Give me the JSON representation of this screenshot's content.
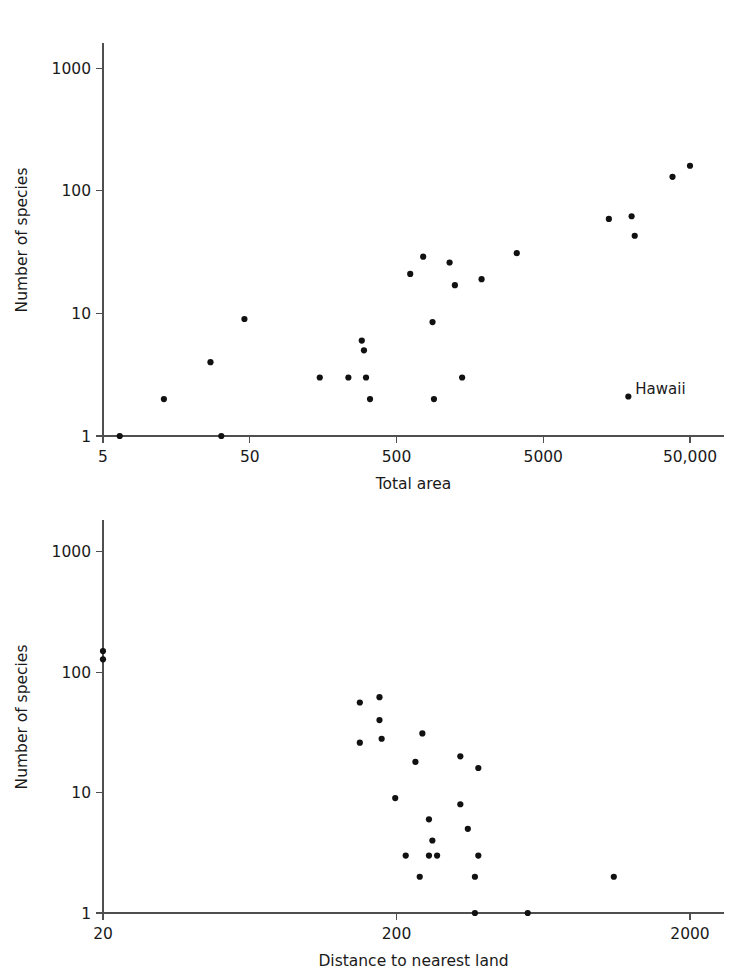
{
  "chart_data": [
    {
      "id": "species-vs-area",
      "type": "scatter",
      "title": "",
      "xlabel": "Total area",
      "ylabel": "Number of species",
      "xscale": "log",
      "yscale": "log",
      "xlim": [
        5,
        70000
      ],
      "ylim": [
        1,
        2000
      ],
      "xticks": [
        5,
        50,
        500,
        5000,
        50000
      ],
      "xticklabels": [
        "5",
        "50",
        "500",
        "5000",
        "50,000"
      ],
      "yticks": [
        1,
        10,
        100,
        1000
      ],
      "yticklabels": [
        "1",
        "10",
        "100",
        "1000"
      ],
      "grid": false,
      "legend": false,
      "points": [
        {
          "x": 6.5,
          "y": 1
        },
        {
          "x": 13,
          "y": 2
        },
        {
          "x": 32,
          "y": 1
        },
        {
          "x": 27,
          "y": 4
        },
        {
          "x": 46,
          "y": 9
        },
        {
          "x": 150,
          "y": 3
        },
        {
          "x": 235,
          "y": 3
        },
        {
          "x": 290,
          "y": 6
        },
        {
          "x": 300,
          "y": 5
        },
        {
          "x": 310,
          "y": 3
        },
        {
          "x": 330,
          "y": 2
        },
        {
          "x": 620,
          "y": 21
        },
        {
          "x": 760,
          "y": 29
        },
        {
          "x": 880,
          "y": 8.5
        },
        {
          "x": 900,
          "y": 2
        },
        {
          "x": 1150,
          "y": 26
        },
        {
          "x": 1250,
          "y": 17
        },
        {
          "x": 1400,
          "y": 3
        },
        {
          "x": 1900,
          "y": 19
        },
        {
          "x": 3300,
          "y": 31
        },
        {
          "x": 14000,
          "y": 59
        },
        {
          "x": 20000,
          "y": 62
        },
        {
          "x": 21000,
          "y": 43
        },
        {
          "x": 38000,
          "y": 130
        },
        {
          "x": 50000,
          "y": 160
        },
        {
          "x": 19000,
          "y": 2.1,
          "label": "Hawaii"
        }
      ],
      "annotations": [
        {
          "text": "Hawaii",
          "x": 19000,
          "y": 2.1
        }
      ]
    },
    {
      "id": "species-vs-distance",
      "type": "scatter",
      "title": "",
      "xlabel": "Distance to nearest land",
      "ylabel": "Number of species",
      "xscale": "log",
      "yscale": "log",
      "xlim": [
        20,
        3000
      ],
      "ylim": [
        1,
        2000
      ],
      "xticks": [
        20,
        200,
        2000
      ],
      "xticklabels": [
        "20",
        "200",
        "2000"
      ],
      "yticks": [
        1,
        10,
        100,
        1000
      ],
      "yticklabels": [
        "1",
        "10",
        "100",
        "1000"
      ],
      "grid": false,
      "legend": false,
      "points": [
        {
          "x": 20,
          "y": 150
        },
        {
          "x": 20,
          "y": 128
        },
        {
          "x": 150,
          "y": 56
        },
        {
          "x": 175,
          "y": 62
        },
        {
          "x": 175,
          "y": 40
        },
        {
          "x": 150,
          "y": 26
        },
        {
          "x": 178,
          "y": 28
        },
        {
          "x": 245,
          "y": 31
        },
        {
          "x": 232,
          "y": 18
        },
        {
          "x": 330,
          "y": 20
        },
        {
          "x": 380,
          "y": 16
        },
        {
          "x": 198,
          "y": 9
        },
        {
          "x": 330,
          "y": 8
        },
        {
          "x": 258,
          "y": 6
        },
        {
          "x": 350,
          "y": 5
        },
        {
          "x": 265,
          "y": 4
        },
        {
          "x": 215,
          "y": 3
        },
        {
          "x": 258,
          "y": 3
        },
        {
          "x": 275,
          "y": 3
        },
        {
          "x": 380,
          "y": 3
        },
        {
          "x": 240,
          "y": 2
        },
        {
          "x": 370,
          "y": 2
        },
        {
          "x": 1100,
          "y": 2
        },
        {
          "x": 370,
          "y": 1
        },
        {
          "x": 560,
          "y": 1
        }
      ],
      "annotations": []
    }
  ],
  "panels": {
    "top": {
      "name": "Species versus total area",
      "xlabel": "Total area",
      "ylabel": "Number of species",
      "xticklabels": [
        "5",
        "50",
        "500",
        "5000",
        "50,000"
      ],
      "yticklabels": [
        "1",
        "10",
        "100",
        "1000"
      ],
      "annotation": "Hawaii"
    },
    "bottom": {
      "name": "Species versus distance to nearest land",
      "xlabel": "Distance to nearest land",
      "ylabel": "Number of species",
      "xticklabels": [
        "20",
        "200",
        "2000"
      ],
      "yticklabels": [
        "1",
        "10",
        "100",
        "1000"
      ]
    }
  },
  "colors": {
    "point": "#111111",
    "axis": "#4f4f4f",
    "text": "#1a1a1a",
    "background": "#ffffff"
  }
}
